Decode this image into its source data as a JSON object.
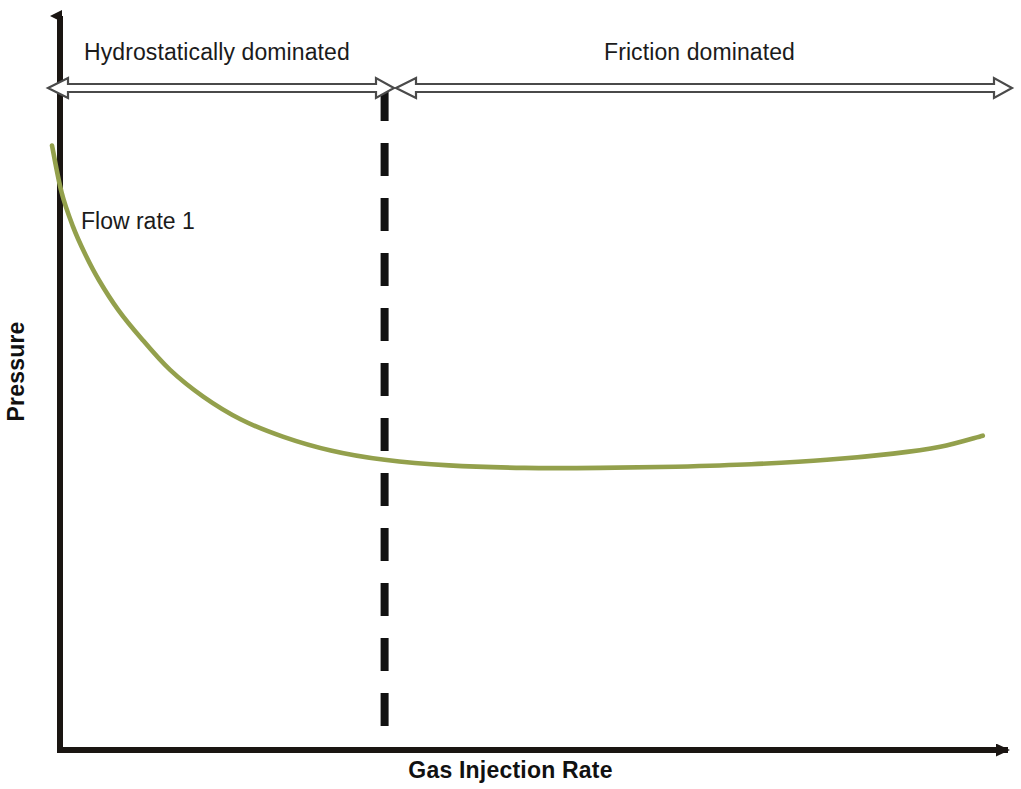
{
  "figure": {
    "background_color": "#ffffff",
    "width": 1021,
    "height": 789
  },
  "axes": {
    "x_label": "Gas Injection Rate",
    "y_label": "Pressure",
    "axis_color": "#1a1512",
    "origin_x": 60,
    "origin_y": 750
  },
  "annotations": {
    "left_region": "Hydrostatically dominated",
    "right_region": "Friction dominated",
    "divider_label": "",
    "arrow_color": "#555555"
  },
  "series_labels": {
    "flow_rate_1": "Flow rate 1"
  },
  "chart_data": {
    "type": "line",
    "title": "",
    "subtitle": "",
    "xlabel": "Gas Injection Rate",
    "ylabel": "Pressure",
    "xlim": [
      0,
      1
    ],
    "ylim": [
      0,
      1
    ],
    "grid": false,
    "legend_position": "inline-annotation",
    "axis_ticks": {
      "x": [],
      "y": []
    },
    "series": [
      {
        "name": "Flow rate 1",
        "color": "#93a04c",
        "line_width": 4,
        "x": [
          0.0,
          0.01,
          0.022,
          0.035,
          0.05,
          0.07,
          0.095,
          0.125,
          0.16,
          0.2,
          0.245,
          0.295,
          0.352,
          0.42,
          0.5,
          0.58,
          0.66,
          0.74,
          0.82,
          0.89,
          0.94,
          0.985
        ],
        "y": [
          0.975,
          0.9,
          0.845,
          0.8,
          0.757,
          0.71,
          0.663,
          0.613,
          0.57,
          0.533,
          0.505,
          0.483,
          0.468,
          0.459,
          0.455,
          0.455,
          0.457,
          0.461,
          0.468,
          0.478,
          0.489,
          0.507
        ]
      }
    ],
    "annotations": [
      {
        "type": "vertical-divider",
        "style": "dashed",
        "color": "#111111",
        "x": 0.352,
        "label": ""
      },
      {
        "type": "span-arrow",
        "label": "Hydrostatically dominated",
        "from_x": 0.0,
        "to_x": 0.352,
        "double_headed": true
      },
      {
        "type": "span-arrow",
        "label": "Friction dominated",
        "from_x": 0.352,
        "to_x": 1.0,
        "double_headed": true
      },
      {
        "type": "text",
        "label": "Flow rate 1",
        "x": 0.024,
        "y": 0.725
      }
    ]
  }
}
